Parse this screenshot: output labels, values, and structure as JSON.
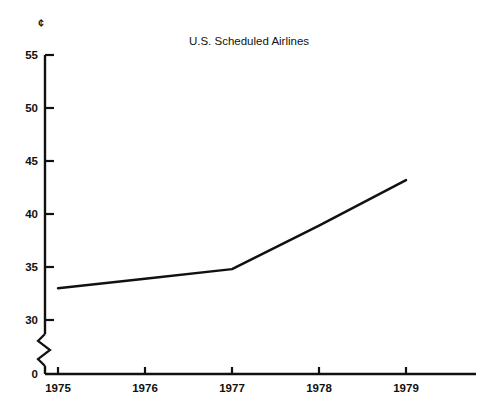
{
  "chart_data": {
    "type": "line",
    "title": "U.S. Scheduled Airlines",
    "xlabel": "",
    "ylabel": "",
    "y_unit_symbol": "¢",
    "x": [
      1975,
      1976,
      1977,
      1978,
      1979
    ],
    "categories": [
      "1975",
      "1976",
      "1977",
      "1978",
      "1979"
    ],
    "series": [
      {
        "name": "U.S. Scheduled Airlines",
        "values": [
          33.0,
          33.9,
          34.8,
          38.9,
          43.2
        ]
      }
    ],
    "xtick_labels": [
      "1975",
      "1976",
      "1977",
      "1978",
      "1979"
    ],
    "ytick_labels": [
      "0",
      "30",
      "35",
      "40",
      "45",
      "50",
      "55"
    ],
    "ytick_values": [
      0,
      30,
      35,
      40,
      45,
      50,
      55
    ],
    "ylim": [
      30,
      55
    ],
    "xlim": [
      1975,
      1979
    ],
    "axis_break": true,
    "axis_break_between": [
      0,
      30
    ],
    "grid": false,
    "legend": false,
    "legend_position": "none",
    "line_color": "#111111",
    "background_color": "#ffffff"
  },
  "figure": {
    "unit_marker": "¢",
    "title": "U.S. Scheduled Airlines"
  }
}
